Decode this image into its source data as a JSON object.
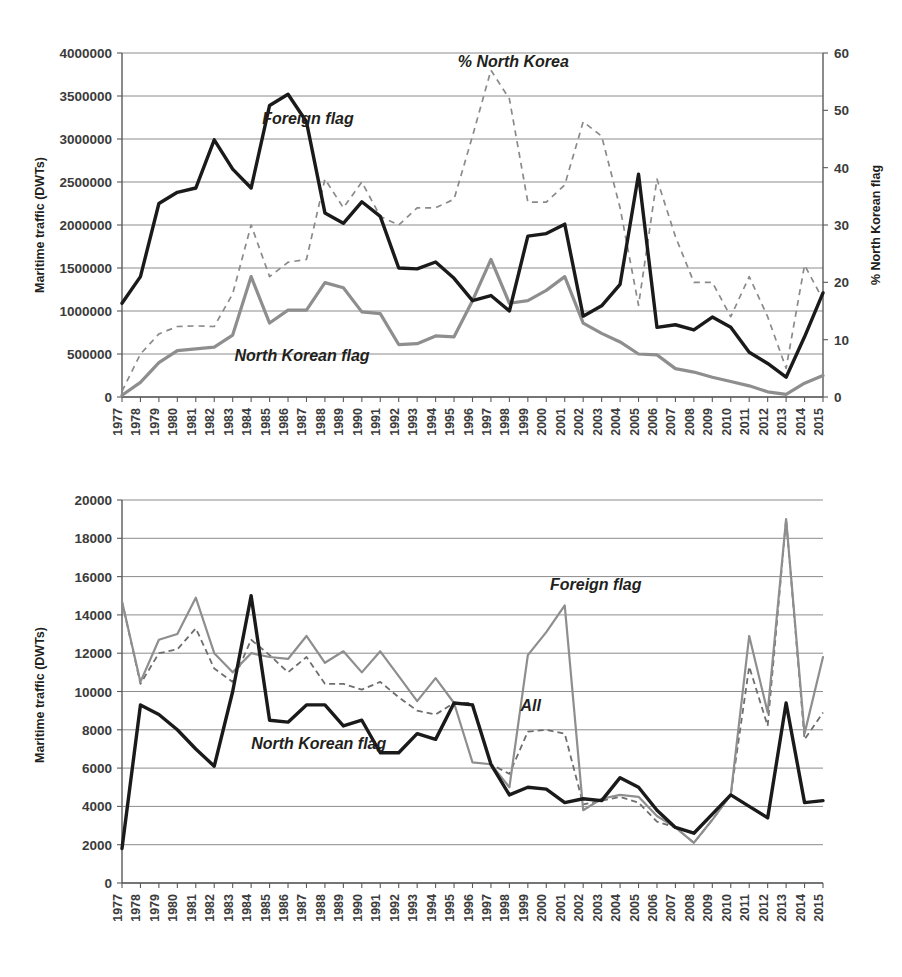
{
  "figure": {
    "title_top": "",
    "title_bottom": ""
  },
  "chart_data": [
    {
      "id": "top",
      "type": "line",
      "title": "",
      "xlabel": "",
      "ylabel": "Maritime traffic (DWTs)",
      "y2label": "% North Korean flag",
      "xlim": [
        1977,
        2015
      ],
      "ylim": [
        0,
        4000000
      ],
      "y2lim": [
        0,
        60
      ],
      "grid": true,
      "legend_position": "inline-annotations",
      "ytick_labels": [
        "0",
        "500000",
        "1000000",
        "1500000",
        "2000000",
        "2500000",
        "3000000",
        "3500000",
        "4000000"
      ],
      "ytick_values": [
        0,
        500000,
        1000000,
        1500000,
        2000000,
        2500000,
        3000000,
        3500000,
        4000000
      ],
      "y2tick_labels": [
        "0",
        "10",
        "20",
        "30",
        "40",
        "50",
        "60"
      ],
      "y2tick_values": [
        0,
        10,
        20,
        30,
        40,
        50,
        60
      ],
      "x": [
        1977,
        1978,
        1979,
        1980,
        1981,
        1982,
        1983,
        1984,
        1985,
        1986,
        1987,
        1988,
        1989,
        1990,
        1991,
        1992,
        1993,
        1994,
        1995,
        1996,
        1997,
        1998,
        1999,
        2000,
        2001,
        2002,
        2003,
        2004,
        2005,
        2006,
        2007,
        2008,
        2009,
        2010,
        2011,
        2012,
        2013,
        2014,
        2015
      ],
      "xtick_labels": [
        "1977",
        "1978",
        "1979",
        "1980",
        "1981",
        "1982",
        "1983",
        "1984",
        "1985",
        "1986",
        "1987",
        "1988",
        "1989",
        "1990",
        "1991",
        "1992",
        "1993",
        "1994",
        "1995",
        "1996",
        "1997",
        "1998",
        "1999",
        "2000",
        "2001",
        "2002",
        "2003",
        "2004",
        "2005",
        "2006",
        "2007",
        "2008",
        "2009",
        "2010",
        "2011",
        "2012",
        "2013",
        "2014",
        "2015"
      ],
      "series": [
        {
          "name": "Foreign flag",
          "axis": "left",
          "style": "solid-dark",
          "label_x": 1984.6,
          "label_y": 3180000,
          "values": [
            1090000,
            1400000,
            2250000,
            2380000,
            2430000,
            2990000,
            2650000,
            2430000,
            3390000,
            3520000,
            3200000,
            2140000,
            2020000,
            2270000,
            2100000,
            1500000,
            1490000,
            1570000,
            1380000,
            1120000,
            1180000,
            1000000,
            1870000,
            1900000,
            2010000,
            940000,
            1060000,
            1310000,
            2590000,
            810000,
            840000,
            780000,
            930000,
            810000,
            520000,
            390000,
            230000,
            700000,
            1210000
          ]
        },
        {
          "name": "North Korean flag",
          "axis": "left",
          "style": "solid-gray",
          "label_x": 1983.1,
          "label_y": 420000,
          "values": [
            20000,
            170000,
            400000,
            540000,
            560000,
            580000,
            720000,
            1400000,
            860000,
            1010000,
            1010000,
            1330000,
            1270000,
            990000,
            970000,
            610000,
            620000,
            710000,
            700000,
            1120000,
            1600000,
            1090000,
            1120000,
            1240000,
            1400000,
            860000,
            740000,
            640000,
            500000,
            490000,
            330000,
            290000,
            230000,
            180000,
            130000,
            60000,
            30000,
            160000,
            250000
          ]
        },
        {
          "name": "% North Korea",
          "axis": "right",
          "style": "dashed",
          "label_x": 1995.2,
          "label_y_pct": 57.5,
          "values": [
            1.0,
            7.5,
            11.0,
            12.3,
            12.4,
            12.3,
            18.0,
            30.0,
            21.0,
            23.5,
            24.0,
            38.0,
            33.0,
            37.5,
            31.5,
            30.0,
            33.0,
            33.0,
            34.5,
            45.5,
            57.0,
            52.0,
            34.0,
            34.0,
            37.0,
            48.0,
            45.5,
            33.0,
            16.0,
            38.0,
            28.0,
            20.0,
            20.0,
            14.0,
            21.0,
            14.0,
            5.0,
            23.0,
            17.0
          ]
        }
      ]
    },
    {
      "id": "bottom",
      "type": "line",
      "title": "",
      "xlabel": "",
      "ylabel": "Maritime traffic (DWTs)",
      "xlim": [
        1977,
        2015
      ],
      "ylim": [
        0,
        20000
      ],
      "grid": true,
      "legend_position": "inline-annotations",
      "ytick_labels": [
        "0",
        "2000",
        "4000",
        "6000",
        "8000",
        "10000",
        "12000",
        "14000",
        "16000",
        "18000",
        "20000"
      ],
      "ytick_values": [
        0,
        2000,
        4000,
        6000,
        8000,
        10000,
        12000,
        14000,
        16000,
        18000,
        20000
      ],
      "x": [
        1977,
        1978,
        1979,
        1980,
        1981,
        1982,
        1983,
        1984,
        1985,
        1986,
        1987,
        1988,
        1989,
        1990,
        1991,
        1992,
        1993,
        1994,
        1995,
        1996,
        1997,
        1998,
        1999,
        2000,
        2001,
        2002,
        2003,
        2004,
        2005,
        2006,
        2007,
        2008,
        2009,
        2010,
        2011,
        2012,
        2013,
        2014,
        2015
      ],
      "xtick_labels": [
        "1977",
        "1978",
        "1979",
        "1980",
        "1981",
        "1982",
        "1983",
        "1984",
        "1985",
        "1986",
        "1987",
        "1988",
        "1989",
        "1990",
        "1991",
        "1992",
        "1993",
        "1994",
        "1995",
        "1996",
        "1997",
        "1998",
        "1999",
        "2000",
        "2001",
        "2002",
        "2003",
        "2004",
        "2005",
        "2006",
        "2007",
        "2008",
        "2009",
        "2010",
        "2011",
        "2012",
        "2013",
        "2014",
        "2015"
      ],
      "series": [
        {
          "name": "Foreign flag",
          "axis": "left",
          "style": "solid-gray",
          "label_x": 2000.2,
          "label_y": 15300,
          "values": [
            14700,
            10500,
            12700,
            13000,
            14900,
            12000,
            11000,
            12000,
            11800,
            11700,
            12900,
            11500,
            12100,
            11000,
            12100,
            10800,
            9500,
            10700,
            9400,
            6300,
            6200,
            5000,
            11900,
            13100,
            14500,
            3800,
            4400,
            4600,
            4500,
            3500,
            2900,
            2100,
            3300,
            4600,
            12900,
            8900,
            19000,
            7800,
            11800
          ]
        },
        {
          "name": "North Korean flag",
          "axis": "left",
          "style": "solid-dark",
          "label_x": 1984.0,
          "label_y": 7000,
          "values": [
            1800,
            9300,
            8800,
            8000,
            7000,
            6100,
            10000,
            15000,
            8500,
            8400,
            9300,
            9300,
            8200,
            8500,
            6800,
            6800,
            7800,
            7500,
            9400,
            9300,
            6200,
            4600,
            5000,
            4900,
            4200,
            4400,
            4300,
            5500,
            5000,
            3800,
            2900,
            2600,
            3600,
            4600,
            4000,
            3400,
            9400,
            4200,
            4300
          ]
        },
        {
          "name": "All",
          "axis": "left",
          "style": "dashed-dark",
          "label_x": 1998.6,
          "label_y": 9000,
          "values": [
            14700,
            10400,
            12000,
            12200,
            13300,
            11200,
            10500,
            12700,
            11900,
            11000,
            11800,
            10400,
            10400,
            10100,
            10500,
            9700,
            9000,
            8800,
            9400,
            9400,
            6200,
            5700,
            7900,
            8000,
            7800,
            4100,
            4300,
            4500,
            4200,
            3200,
            2900,
            2100,
            3300,
            4600,
            11300,
            8200,
            19000,
            7500,
            8900
          ]
        }
      ]
    }
  ]
}
